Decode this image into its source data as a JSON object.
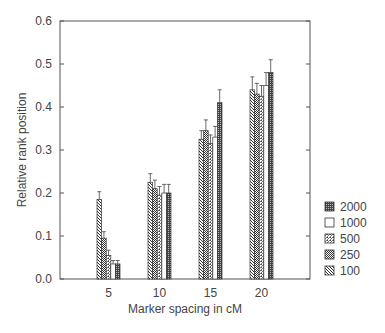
{
  "chart_data": {
    "type": "bar",
    "title": "",
    "xlabel": "Marker spacing in cM",
    "ylabel": "Relative rank position",
    "ylim": [
      0.0,
      0.6
    ],
    "yticks": [
      "0.0",
      "0.1",
      "0.2",
      "0.3",
      "0.4",
      "0.5",
      "0.6"
    ],
    "categories": [
      "5",
      "10",
      "15",
      "20"
    ],
    "grid": false,
    "legend_position": "right",
    "error_bars": true,
    "series": [
      {
        "name": "100",
        "pattern": "diag-hatch",
        "values": [
          0.185,
          0.225,
          0.325,
          0.44
        ],
        "errors": [
          0.018,
          0.02,
          0.02,
          0.03
        ]
      },
      {
        "name": "250",
        "pattern": "check",
        "values": [
          0.095,
          0.21,
          0.345,
          0.43
        ],
        "errors": [
          0.015,
          0.02,
          0.025,
          0.025
        ]
      },
      {
        "name": "500",
        "pattern": "fine-dot",
        "values": [
          0.055,
          0.195,
          0.315,
          0.425
        ],
        "errors": [
          0.012,
          0.02,
          0.02,
          0.025
        ]
      },
      {
        "name": "1000",
        "pattern": "blank",
        "values": [
          0.035,
          0.2,
          0.33,
          0.45
        ],
        "errors": [
          0.008,
          0.02,
          0.025,
          0.03
        ]
      },
      {
        "name": "2000",
        "pattern": "dark-dot",
        "values": [
          0.035,
          0.2,
          0.41,
          0.48
        ],
        "errors": [
          0.008,
          0.02,
          0.03,
          0.03
        ]
      }
    ],
    "legend": [
      "2000",
      "1000",
      "500",
      "250",
      "100"
    ]
  }
}
